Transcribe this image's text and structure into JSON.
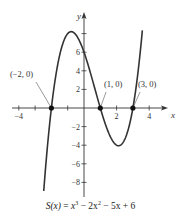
{
  "chart_data": {
    "type": "line",
    "title": "",
    "function": "S(x) = x^3 - 2x^2 - 5x + 6",
    "caption": {
      "lhs": "S(x)",
      "rhs_parts": [
        "x",
        "3",
        " − 2x",
        "2",
        " − 5x + 6"
      ]
    },
    "xlabel": "x",
    "ylabel": "y",
    "x_ticks": [
      -4,
      -3,
      -2,
      -1,
      1,
      2,
      3,
      4
    ],
    "x_tick_labels": [
      {
        "value": -4,
        "label": "−4"
      },
      {
        "value": 2,
        "label": "2"
      },
      {
        "value": 4,
        "label": "4"
      }
    ],
    "y_ticks": [
      -8,
      -6,
      -4,
      -2,
      2,
      4,
      6,
      8
    ],
    "y_tick_labels": [
      {
        "value": 6,
        "label": "6"
      },
      {
        "value": 4,
        "label": "4"
      },
      {
        "value": 2,
        "label": "2"
      },
      {
        "value": -2,
        "label": "−2"
      },
      {
        "value": -4,
        "label": "−4"
      },
      {
        "value": -6,
        "label": "−6"
      },
      {
        "value": -8,
        "label": "−8"
      }
    ],
    "xlim": [
      -4.5,
      5
    ],
    "ylim": [
      -9.5,
      10
    ],
    "grid": false,
    "curve_domain": [
      -2.47,
      3.58
    ],
    "series": [
      {
        "name": "S(x)",
        "x": [
          -2.47,
          -2,
          -1.5,
          -1,
          -0.79,
          0,
          0.5,
          1,
          1.5,
          2,
          2.12,
          2.5,
          3,
          3.58
        ],
        "y": [
          -9.3,
          0,
          5.63,
          8,
          8.21,
          6,
          3.38,
          0,
          -2.63,
          -4,
          -4.06,
          -3.38,
          0,
          8.3
        ]
      }
    ],
    "points": [
      {
        "x": -2,
        "y": 0,
        "label": "(−2, 0)"
      },
      {
        "x": 1,
        "y": 0,
        "label": "(1, 0)"
      },
      {
        "x": 3,
        "y": 0,
        "label": "(3, 0)"
      }
    ],
    "colors": {
      "curve": "#333333",
      "axis": "#333333",
      "point": "#111111"
    }
  }
}
